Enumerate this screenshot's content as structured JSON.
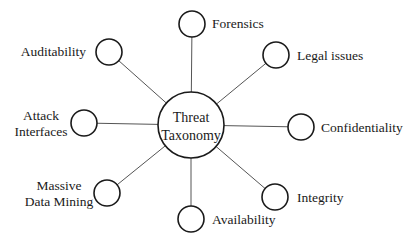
{
  "diagram": {
    "type": "hub-and-spoke",
    "center": {
      "label_lines": [
        "Threat",
        "Taxonomy"
      ],
      "cx": 191,
      "cy": 125,
      "r": 33
    },
    "nodes": [
      {
        "id": "forensics",
        "label_lines": [
          "Forensics"
        ],
        "cx": 192,
        "cy": 24,
        "label_x": 212,
        "label_y": 28,
        "anchor": "start"
      },
      {
        "id": "legal-issues",
        "label_lines": [
          "Legal issues"
        ],
        "cx": 276,
        "cy": 55,
        "label_x": 297,
        "label_y": 60,
        "anchor": "start"
      },
      {
        "id": "confidentiality",
        "label_lines": [
          "Confidentiality"
        ],
        "cx": 301,
        "cy": 127,
        "label_x": 321,
        "label_y": 132,
        "anchor": "start"
      },
      {
        "id": "integrity",
        "label_lines": [
          "Integrity"
        ],
        "cx": 275,
        "cy": 197,
        "label_x": 297,
        "label_y": 202,
        "anchor": "start"
      },
      {
        "id": "availability",
        "label_lines": [
          "Availability"
        ],
        "cx": 191,
        "cy": 219,
        "label_x": 212,
        "label_y": 224,
        "anchor": "start"
      },
      {
        "id": "massive-data-mining",
        "label_lines": [
          "Massive",
          "Data Mining"
        ],
        "cx": 107,
        "cy": 193,
        "label_x": 59,
        "label_y": 190,
        "anchor": "middle"
      },
      {
        "id": "attack-interfaces",
        "label_lines": [
          "Attack",
          "Interfaces"
        ],
        "cx": 84,
        "cy": 123,
        "label_x": 41,
        "label_y": 120,
        "anchor": "middle"
      },
      {
        "id": "auditability",
        "label_lines": [
          "Auditability"
        ],
        "cx": 109,
        "cy": 52,
        "label_x": 86,
        "label_y": 56,
        "anchor": "end"
      }
    ],
    "node_radius": 13,
    "colors": {
      "stroke": "#1a1a1a",
      "edge": "#555555",
      "background": "#ffffff"
    }
  }
}
